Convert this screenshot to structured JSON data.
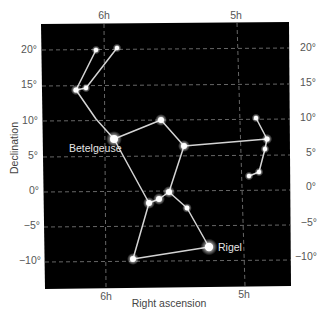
{
  "chart_data": {
    "type": "scatter",
    "xlabel": "Right ascension",
    "ylabel": "Declination",
    "x_ticks": [
      "6h",
      "5h"
    ],
    "y_ticks_left": [
      "20°",
      "15°",
      "10°",
      "5°",
      "0°",
      "−5°",
      "−10°"
    ],
    "y_ticks_right": [
      "20°",
      "15°",
      "10°",
      "5°",
      "0°",
      "−5°",
      "−10°"
    ],
    "y_tick_values": [
      20,
      15,
      10,
      5,
      0,
      -5,
      -10
    ],
    "grid": true,
    "background": "#000000",
    "line_color": "#d9d9d9",
    "star_color": "#ffffff",
    "stars": [
      {
        "id": "club1",
        "x": 96,
        "y": 50,
        "r": 2.2
      },
      {
        "id": "club2",
        "x": 117,
        "y": 48,
        "r": 2.2
      },
      {
        "id": "arm1",
        "x": 76,
        "y": 90,
        "r": 2.6
      },
      {
        "id": "arm2",
        "x": 86,
        "y": 88,
        "r": 2.2
      },
      {
        "id": "betelgeuse",
        "name": "Betelgeuse",
        "x": 114,
        "y": 139,
        "r": 4
      },
      {
        "id": "meissa",
        "x": 161,
        "y": 120,
        "r": 3
      },
      {
        "id": "bellatrix",
        "x": 184,
        "y": 146,
        "r": 3
      },
      {
        "id": "shield1",
        "x": 256,
        "y": 118,
        "r": 2.2
      },
      {
        "id": "shield2",
        "x": 267,
        "y": 139,
        "r": 2.6
      },
      {
        "id": "shield3",
        "x": 265,
        "y": 149,
        "r": 2.2
      },
      {
        "id": "shield4",
        "x": 259,
        "y": 172,
        "r": 2.2
      },
      {
        "id": "shield5",
        "x": 249,
        "y": 176,
        "r": 2.2
      },
      {
        "id": "alnitak",
        "x": 149,
        "y": 203,
        "r": 3
      },
      {
        "id": "alnilam",
        "x": 159,
        "y": 199,
        "r": 3
      },
      {
        "id": "mintaka",
        "x": 169,
        "y": 192,
        "r": 3
      },
      {
        "id": "sword",
        "x": 187,
        "y": 208,
        "r": 2.4
      },
      {
        "id": "rigel",
        "name": "Rigel",
        "x": 209,
        "y": 247,
        "r": 4.2
      },
      {
        "id": "saiph",
        "x": 133,
        "y": 259,
        "r": 3
      }
    ],
    "lines": [
      [
        [
          96,
          50
        ],
        [
          76,
          90
        ]
      ],
      [
        [
          117,
          48
        ],
        [
          86,
          88
        ],
        [
          76,
          90
        ]
      ],
      [
        [
          76,
          90
        ],
        [
          96,
          119
        ],
        [
          114,
          139
        ]
      ],
      [
        [
          114,
          139
        ],
        [
          161,
          120
        ],
        [
          184,
          146
        ]
      ],
      [
        [
          184,
          146
        ],
        [
          267,
          139
        ]
      ],
      [
        [
          256,
          118
        ],
        [
          267,
          139
        ],
        [
          265,
          149
        ],
        [
          259,
          172
        ],
        [
          249,
          176
        ]
      ],
      [
        [
          114,
          139
        ],
        [
          149,
          203
        ]
      ],
      [
        [
          184,
          146
        ],
        [
          169,
          192
        ]
      ],
      [
        [
          149,
          203
        ],
        [
          159,
          199
        ],
        [
          169,
          192
        ]
      ],
      [
        [
          169,
          192
        ],
        [
          187,
          208
        ],
        [
          209,
          247
        ]
      ],
      [
        [
          149,
          203
        ],
        [
          133,
          259
        ]
      ],
      [
        [
          133,
          259
        ],
        [
          209,
          247
        ]
      ]
    ],
    "labels": [
      {
        "text": "Betelgeuse",
        "x": 69,
        "y": 152
      },
      {
        "text": "Rigel",
        "x": 218,
        "y": 251
      }
    ]
  }
}
